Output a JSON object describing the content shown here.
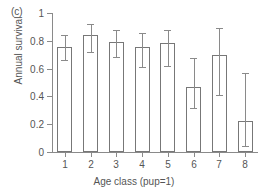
{
  "figure": {
    "panel_label": "(c)",
    "xlabel": "Age class (pup=1)",
    "ylabel": "Annual survival"
  },
  "axis": {
    "y_ticks": [
      "0",
      "0.2",
      "0.4",
      "0.6",
      "0.8",
      "1"
    ],
    "y_tick_values": [
      0,
      0.2,
      0.4,
      0.6,
      0.8,
      1
    ],
    "x_ticks": [
      "1",
      "2",
      "3",
      "4",
      "5",
      "6",
      "7",
      "8"
    ]
  },
  "colors": {
    "bar_fill": "#ffffff",
    "bar_edge": "#777777",
    "axis": "#8a8a8a",
    "text": "#555555",
    "background": "#ffffff"
  },
  "chart_data": {
    "type": "bar",
    "title": "(c)",
    "xlabel": "Age class (pup=1)",
    "ylabel": "Annual survival",
    "categories": [
      "1",
      "2",
      "3",
      "4",
      "5",
      "6",
      "7",
      "8"
    ],
    "values": [
      0.755,
      0.84,
      0.79,
      0.755,
      0.785,
      0.47,
      0.7,
      0.225
    ],
    "error_low": [
      0.66,
      0.72,
      0.68,
      0.61,
      0.62,
      0.315,
      0.41,
      0.045
    ],
    "error_high": [
      0.84,
      0.92,
      0.88,
      0.855,
      0.88,
      0.675,
      0.89,
      0.565
    ],
    "ylim": [
      0,
      1
    ],
    "yticks": [
      0,
      0.2,
      0.4,
      0.6,
      0.8,
      1
    ],
    "grid": false,
    "legend": "none",
    "bar_style": "open/unfilled with error bars (95% CI)"
  }
}
